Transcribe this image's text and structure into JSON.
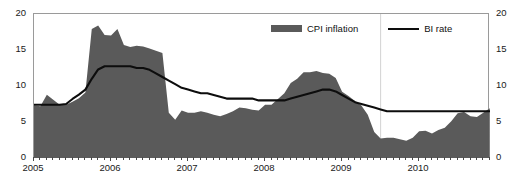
{
  "figure": {
    "top_sliver_text": "",
    "background_color": "#ffffff",
    "frame_color": "#9a9a9a"
  },
  "legend": {
    "position": "top-center",
    "items": [
      {
        "label": "CPI inflation",
        "marker": "area-swatch",
        "color": "#5a5a5a"
      },
      {
        "label": "BI rate",
        "marker": "line-swatch",
        "color": "#0d0d0d"
      }
    ]
  },
  "axes": {
    "y_left": {
      "ticks": [
        "0",
        "5",
        "10",
        "15",
        "20"
      ],
      "min": 0,
      "max": 20
    },
    "y_right": {
      "ticks": [
        "0",
        "5",
        "10",
        "15",
        "20"
      ],
      "min": 0,
      "max": 20
    },
    "x": {
      "ticks": [
        "2005",
        "2006",
        "2007",
        "2008",
        "2009",
        "2010"
      ]
    }
  },
  "chart_data": {
    "type": "area",
    "title": "",
    "subtitle": "",
    "xlabel": "",
    "ylabel": "",
    "xlim": [
      2005.0,
      2010.92
    ],
    "ylim": [
      0,
      20
    ],
    "grid": false,
    "legend_position": "top-center",
    "x_tick_labels": [
      "2005",
      "2006",
      "2007",
      "2008",
      "2009",
      "2010"
    ],
    "x_tick_values": [
      2005,
      2006,
      2007,
      2008,
      2009,
      2010
    ],
    "y_tick_values": [
      0,
      5,
      10,
      15,
      20
    ],
    "x": [
      2005.0,
      2005.083,
      2005.167,
      2005.25,
      2005.333,
      2005.417,
      2005.5,
      2005.583,
      2005.667,
      2005.75,
      2005.833,
      2005.917,
      2006.0,
      2006.083,
      2006.167,
      2006.25,
      2006.333,
      2006.417,
      2006.5,
      2006.583,
      2006.667,
      2006.75,
      2006.833,
      2006.917,
      2007.0,
      2007.083,
      2007.167,
      2007.25,
      2007.333,
      2007.417,
      2007.5,
      2007.583,
      2007.667,
      2007.75,
      2007.833,
      2007.917,
      2008.0,
      2008.083,
      2008.167,
      2008.25,
      2008.333,
      2008.417,
      2008.5,
      2008.583,
      2008.667,
      2008.75,
      2008.833,
      2008.917,
      2009.0,
      2009.083,
      2009.167,
      2009.25,
      2009.333,
      2009.417,
      2009.5,
      2009.583,
      2009.667,
      2009.75,
      2009.833,
      2009.917,
      2010.0,
      2010.083,
      2010.167,
      2010.25,
      2010.333,
      2010.417,
      2010.5,
      2010.583,
      2010.667,
      2010.75,
      2010.833,
      2010.917
    ],
    "series": [
      {
        "name": "CPI inflation",
        "type": "area",
        "color": "#5a5a5a",
        "values": [
          7.3,
          7.2,
          8.8,
          8.1,
          7.4,
          7.4,
          7.8,
          8.3,
          9.1,
          17.9,
          18.4,
          17.1,
          17.0,
          17.9,
          15.7,
          15.4,
          15.6,
          15.5,
          15.2,
          14.9,
          14.6,
          6.3,
          5.3,
          6.6,
          6.3,
          6.3,
          6.5,
          6.3,
          6.0,
          5.8,
          6.1,
          6.5,
          7.0,
          6.9,
          6.7,
          6.6,
          7.4,
          7.4,
          8.2,
          9.0,
          10.4,
          11.0,
          11.9,
          11.9,
          12.1,
          11.8,
          11.7,
          11.1,
          9.2,
          8.6,
          7.9,
          7.3,
          6.0,
          3.6,
          2.7,
          2.8,
          2.8,
          2.6,
          2.4,
          2.8,
          3.7,
          3.8,
          3.4,
          3.9,
          4.2,
          5.1,
          6.2,
          6.4,
          5.8,
          5.7,
          6.3,
          6.9
        ]
      },
      {
        "name": "BI rate",
        "type": "line",
        "color": "#0d0d0d",
        "values": [
          7.4,
          7.4,
          7.4,
          7.4,
          7.4,
          7.5,
          8.2,
          8.8,
          9.5,
          11.0,
          12.3,
          12.75,
          12.75,
          12.75,
          12.75,
          12.75,
          12.5,
          12.5,
          12.25,
          11.75,
          11.25,
          10.75,
          10.25,
          9.75,
          9.5,
          9.25,
          9.0,
          9.0,
          8.75,
          8.5,
          8.25,
          8.25,
          8.25,
          8.25,
          8.25,
          8.0,
          8.0,
          8.0,
          8.0,
          8.0,
          8.25,
          8.5,
          8.75,
          9.0,
          9.25,
          9.5,
          9.5,
          9.25,
          8.75,
          8.25,
          7.75,
          7.5,
          7.25,
          7.0,
          6.75,
          6.5,
          6.5,
          6.5,
          6.5,
          6.5,
          6.5,
          6.5,
          6.5,
          6.5,
          6.5,
          6.5,
          6.5,
          6.5,
          6.5,
          6.5,
          6.5,
          6.5
        ]
      }
    ]
  }
}
